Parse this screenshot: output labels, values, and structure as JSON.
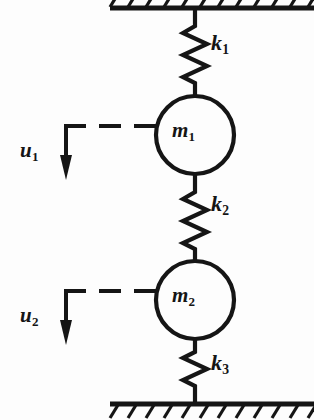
{
  "figure": {
    "type": "mechanical-schematic",
    "background_color": "#fdfdfd",
    "ink_color": "#151515"
  },
  "supports": {
    "top": {
      "name": "fixed upper support",
      "hatch_direction": "down-right",
      "line_y": 8,
      "x_start": 110,
      "x_end": 314
    },
    "bottom": {
      "name": "fixed lower ground",
      "hatch_direction": "down-right",
      "line_y": 404,
      "x_start": 110,
      "x_end": 314
    }
  },
  "springs": [
    {
      "id": "k1",
      "label": "k",
      "subscript": "1",
      "from": "top support",
      "to": "mass m1",
      "coils": 5,
      "y_top": 8,
      "y_bottom": 96
    },
    {
      "id": "k2",
      "label": "k",
      "subscript": "2",
      "from": "mass m1",
      "to": "mass m2",
      "coils": 5,
      "y_top": 174,
      "y_bottom": 262
    },
    {
      "id": "k3",
      "label": "k",
      "subscript": "3",
      "from": "mass m2",
      "to": "bottom ground",
      "coils": 5,
      "y_top": 330,
      "y_bottom": 404
    }
  ],
  "masses": [
    {
      "id": "m1",
      "label": "m",
      "subscript": "1",
      "center_x": 195,
      "center_y": 135,
      "radius": 39
    },
    {
      "id": "m2",
      "label": "m",
      "subscript": "2",
      "center_x": 195,
      "center_y": 300,
      "radius": 39
    }
  ],
  "displacements": [
    {
      "id": "u1",
      "label": "u",
      "subscript": "1",
      "direction": "downward",
      "attached_to": "m1",
      "leader_style": "dashed",
      "arrow_x": 66,
      "arrow_y_top": 126,
      "arrow_y_bottom": 172
    },
    {
      "id": "u2",
      "label": "u",
      "subscript": "2",
      "direction": "downward",
      "attached_to": "m2",
      "leader_style": "dashed",
      "arrow_x": 66,
      "arrow_y_top": 291,
      "arrow_y_bottom": 337
    }
  ]
}
